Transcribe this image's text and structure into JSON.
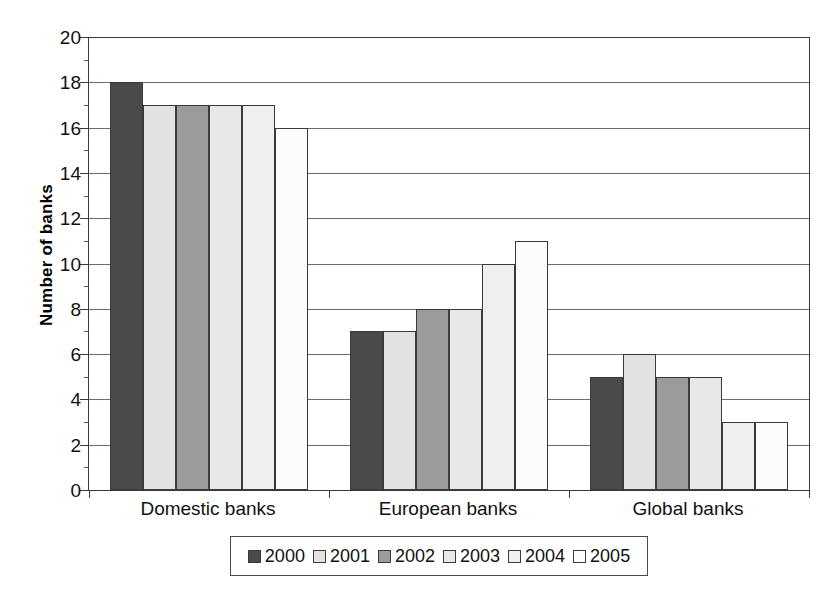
{
  "chart_data": {
    "type": "bar",
    "title": "",
    "subtitle": "",
    "xlabel": "",
    "ylabel": "Number of banks",
    "categories": [
      "Domestic banks",
      "European banks",
      "Global banks"
    ],
    "series": [
      {
        "name": "2000",
        "values": [
          18,
          7,
          5
        ],
        "color": "#4a4a4a"
      },
      {
        "name": "2001",
        "values": [
          17,
          7,
          6
        ],
        "color": "#e2e2e2"
      },
      {
        "name": "2002",
        "values": [
          17,
          8,
          5
        ],
        "color": "#9b9b9b"
      },
      {
        "name": "2003",
        "values": [
          17,
          8,
          5
        ],
        "color": "#e8e8e8"
      },
      {
        "name": "2004",
        "values": [
          17,
          10,
          3
        ],
        "color": "#efefef"
      },
      {
        "name": "2005",
        "values": [
          16,
          11,
          3
        ],
        "color": "#fcfcfc"
      }
    ],
    "ylim": [
      0,
      20
    ],
    "ytick_step": 2,
    "yticks": [
      0,
      2,
      4,
      6,
      8,
      10,
      12,
      14,
      16,
      18,
      20
    ],
    "ytick_labels": [
      "0",
      "2",
      "4",
      "6",
      "8",
      "10",
      "12",
      "14",
      "16",
      "18",
      "20"
    ],
    "grid": true,
    "grid_axis": "y",
    "legend": true,
    "legend_position": "bottom",
    "bar_style": "grouped",
    "axis_color": "#3a3a3a",
    "grid_color": "#6d6d6d",
    "background": "#ffffff"
  },
  "legend": {
    "entries": [
      {
        "label": "2000",
        "color": "#4a4a4a"
      },
      {
        "label": "2001",
        "color": "#e2e2e2"
      },
      {
        "label": "2002",
        "color": "#9b9b9b"
      },
      {
        "label": "2003",
        "color": "#e8e8e8"
      },
      {
        "label": "2004",
        "color": "#efefef"
      },
      {
        "label": "2005",
        "color": "#fcfcfc"
      }
    ]
  }
}
